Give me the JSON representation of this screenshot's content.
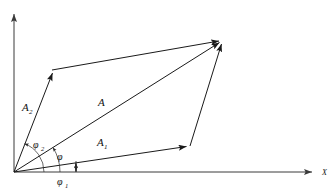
{
  "figure": {
    "background_color": "#ffffff",
    "line_color": "#1a1a1a",
    "axis_color": "#3a3a3a"
  },
  "axes": {
    "x_label": "X",
    "y_label": "",
    "origin": {
      "x": 14,
      "y": 172
    },
    "x_axis": {
      "x1": 14,
      "y1": 172,
      "x2": 318,
      "y2": 172
    },
    "y_axis": {
      "x1": 14,
      "y1": 172,
      "x2": 14,
      "y2": 9
    }
  },
  "vectors": [
    {
      "name": "A",
      "label": "A",
      "subscript": "",
      "label_x": 98,
      "label_y": 106,
      "from": {
        "x": 14,
        "y": 172
      },
      "to": {
        "x": 223,
        "y": 40
      },
      "angle_from_x_axis_deg": 32.3
    },
    {
      "name": "A1",
      "label": "A",
      "subscript": "1",
      "label_x": 97,
      "label_y": 146,
      "from": {
        "x": 14,
        "y": 172
      },
      "to": {
        "x": 190,
        "y": 146
      },
      "angle_from_x_axis_deg": 8.4
    },
    {
      "name": "A2",
      "label": "A",
      "subscript": "2",
      "label_x": 24,
      "label_y": 111,
      "from": {
        "x": 14,
        "y": 172
      },
      "to": {
        "x": 52,
        "y": 70
      },
      "angle_from_x_axis_deg": 69.6
    }
  ],
  "parallelogram_sides": [
    {
      "name": "side-a2-to-top",
      "from": {
        "x": 52,
        "y": 70
      },
      "to": {
        "x": 223,
        "y": 40
      }
    },
    {
      "name": "side-a1-to-top",
      "from": {
        "x": 190,
        "y": 146
      },
      "to": {
        "x": 223,
        "y": 40
      }
    }
  ],
  "angles": [
    {
      "name": "phi2",
      "label": "φ",
      "subscript": "2",
      "label_x": 35,
      "label_y": 147,
      "value_deg": 69.6,
      "arc_radius": 30,
      "description": "angle between X axis and A2"
    },
    {
      "name": "phi",
      "label": "φ",
      "subscript": "",
      "label_x": 58,
      "label_y": 159,
      "value_deg": 32.3,
      "arc_radius": 46,
      "description": "angle between X axis and A"
    },
    {
      "name": "phi1",
      "label": "φ",
      "subscript": "1",
      "label_x": 59,
      "label_y": 184,
      "value_deg": 8.4,
      "arc_radius": 62,
      "description": "angle between X axis and A1"
    }
  ],
  "annotations": {
    "phi1_tick": {
      "x": 76,
      "y_top": 161,
      "y_bottom": 172
    }
  }
}
